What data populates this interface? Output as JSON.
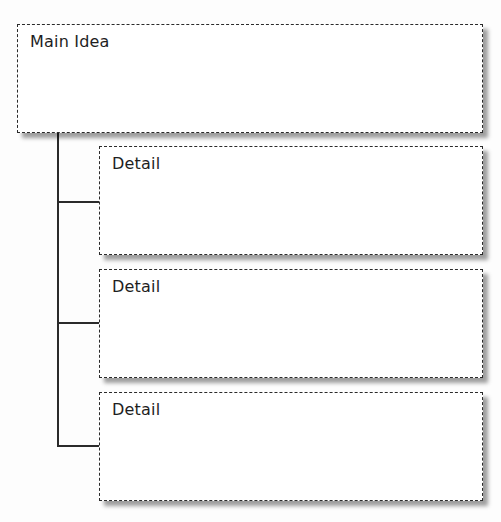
{
  "diagram": {
    "type": "hierarchy",
    "main": {
      "label": "Main Idea"
    },
    "details": [
      {
        "label": "Detail"
      },
      {
        "label": "Detail"
      },
      {
        "label": "Detail"
      }
    ]
  }
}
